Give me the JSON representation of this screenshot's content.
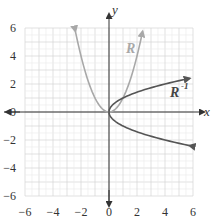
{
  "chart_data": {
    "type": "line",
    "title": "",
    "xlabel": "x",
    "ylabel": "y",
    "xlim": [
      -6,
      6
    ],
    "ylim": [
      -6,
      6
    ],
    "grid": true,
    "x_ticks": [
      "-6",
      "-4",
      "-2",
      "0",
      "2",
      "4",
      "6"
    ],
    "y_ticks": [
      "6",
      "4",
      "2",
      "0",
      "-2",
      "-4",
      "-6"
    ],
    "series": [
      {
        "name": "R",
        "description": "y = x^2 (parabola opening up)",
        "color": "#a8a8a8",
        "points": [
          [
            -2.4,
            5.76
          ],
          [
            -2,
            4
          ],
          [
            -1,
            1
          ],
          [
            0,
            0
          ],
          [
            1,
            1
          ],
          [
            2,
            4
          ],
          [
            2.4,
            5.76
          ]
        ]
      },
      {
        "name": "R^-1",
        "description": "x = y^2 (parabola opening right)",
        "color": "#666666",
        "points": [
          [
            5.76,
            2.4
          ],
          [
            4,
            2
          ],
          [
            1,
            1
          ],
          [
            0,
            0
          ],
          [
            1,
            -1
          ],
          [
            4,
            -2
          ],
          [
            5.76,
            -2.4
          ]
        ]
      }
    ],
    "annotations": [
      {
        "text": "R",
        "x": 1.6,
        "y": 4.3
      },
      {
        "text": "R",
        "superscript": "-1",
        "x": 3.8,
        "y": 1.4
      }
    ]
  },
  "labels": {
    "x_axis": "x",
    "y_axis": "y",
    "r": "R",
    "rinv": "R",
    "rinv_sup": "-1"
  },
  "ticks": {
    "x": [
      "−6",
      "−4",
      "−2",
      "0",
      "2",
      "4",
      "6"
    ],
    "y": [
      "6",
      "4",
      "2",
      "0",
      "−2",
      "−4",
      "−6"
    ]
  }
}
